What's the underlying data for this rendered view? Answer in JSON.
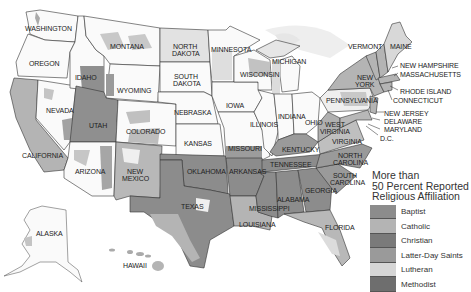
{
  "legend": {
    "title_line1": "More than",
    "title_line2": "50 Percent Reported",
    "title_line3": "Religious Affiliation",
    "items": [
      {
        "label": "Baptist",
        "color": "#8c8c8c"
      },
      {
        "label": "Catholic",
        "color": "#b4b4b4"
      },
      {
        "label": "Christian",
        "color": "#7a7a7a"
      },
      {
        "label": "Latter-Day Saints",
        "color": "#9a9a9a"
      },
      {
        "label": "Lutheran",
        "color": "#d6d6d6"
      },
      {
        "label": "Methodist",
        "color": "#6e6e6e"
      }
    ]
  },
  "states": {
    "washington": "WASHINGTON",
    "oregon": "OREGON",
    "idaho": "IDAHO",
    "montana": "MONTANA",
    "wyoming": "WYOMING",
    "north_dakota_1": "NORTH",
    "north_dakota_2": "DAKOTA",
    "south_dakota_1": "SOUTH",
    "south_dakota_2": "DAKOTA",
    "minnesota": "MINNESOTA",
    "wisconsin": "WISCONSIN",
    "michigan": "MICHIGAN",
    "nevada": "NEVADA",
    "utah": "UTAH",
    "colorado": "COLORADO",
    "california": "CALIFORNIA",
    "arizona": "ARIZONA",
    "new_mexico_1": "NEW",
    "new_mexico_2": "MEXICO",
    "nebraska": "NEBRASKA",
    "iowa": "IOWA",
    "kansas": "KANSAS",
    "illinois": "ILLINOIS",
    "indiana": "INDIANA",
    "ohio": "OHIO",
    "missouri": "MISSOURI",
    "kentucky": "KENTUCKY",
    "oklahoma": "OKLAHOMA",
    "arkansas": "ARKANSAS",
    "tennessee": "TENNESSEE",
    "texas": "TEXAS",
    "louisiana": "LOUISIANA",
    "mississippi": "MISSISSIPPI",
    "alabama": "ALABAMA",
    "georgia": "GEORGIA",
    "florida": "FLORIDA",
    "south_carolina_1": "SOUTH",
    "south_carolina_2": "CAROLINA",
    "north_carolina_1": "NORTH",
    "north_carolina_2": "CAROLINA",
    "virginia": "VIRGINIA",
    "west_virginia_1": "WEST",
    "west_virginia_2": "VIRGINIA",
    "pennsylvania": "PENNSYLVANIA",
    "new_york_1": "NEW",
    "new_york_2": "YORK",
    "vermont": "VERMONT",
    "maine": "MAINE",
    "new_hampshire": "NEW HAMPSHIRE",
    "massachusetts": "MASSACHUSETTS",
    "rhode_island": "RHODE ISLAND",
    "connecticut": "CONNECTICUT",
    "new_jersey": "NEW JERSEY",
    "delaware": "DELAWARE",
    "maryland": "MARYLAND",
    "dc": "D.C.",
    "alaska": "ALASKA",
    "hawaii": "HAWAII"
  }
}
